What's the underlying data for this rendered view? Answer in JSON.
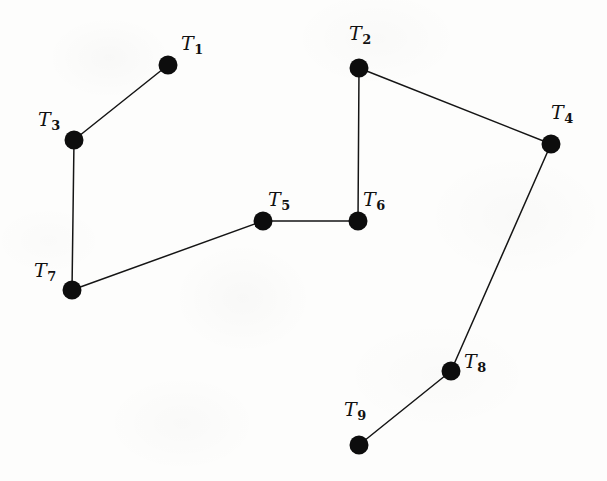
{
  "figure": {
    "kind": "undirected-graph-diagram",
    "background_color": "#fdfdfc",
    "ink_color": "#111111",
    "width": 607,
    "height": 481,
    "vertex_radius": 9.5,
    "edge_stroke_width": 1.5
  },
  "vertices": [
    {
      "id": "T1",
      "label": "T",
      "subscript": "1",
      "x": 168,
      "y": 65,
      "label_x": 181,
      "label_y": 34
    },
    {
      "id": "T2",
      "label": "T",
      "subscript": "2",
      "x": 359,
      "y": 68,
      "label_x": 349,
      "label_y": 24
    },
    {
      "id": "T3",
      "label": "T",
      "subscript": "3",
      "x": 74,
      "y": 140,
      "label_x": 38,
      "label_y": 110
    },
    {
      "id": "T4",
      "label": "T",
      "subscript": "4",
      "x": 551,
      "y": 144,
      "label_x": 551,
      "label_y": 103
    },
    {
      "id": "T5",
      "label": "T",
      "subscript": "5",
      "x": 263,
      "y": 221,
      "label_x": 268,
      "label_y": 190
    },
    {
      "id": "T6",
      "label": "T",
      "subscript": "6",
      "x": 358,
      "y": 221,
      "label_x": 363,
      "label_y": 190
    },
    {
      "id": "T7",
      "label": "T",
      "subscript": "7",
      "x": 72,
      "y": 290,
      "label_x": 34,
      "label_y": 261
    },
    {
      "id": "T8",
      "label": "T",
      "subscript": "8",
      "x": 451,
      "y": 371,
      "label_x": 464,
      "label_y": 352
    },
    {
      "id": "T9",
      "label": "T",
      "subscript": "9",
      "x": 359,
      "y": 445,
      "label_x": 344,
      "label_y": 400
    }
  ],
  "edges": [
    {
      "id": "edge-T1-T3",
      "from": "T1",
      "to": "T3",
      "x1": 168,
      "y1": 65,
      "x2": 74,
      "y2": 140
    },
    {
      "id": "edge-T2-T4",
      "from": "T2",
      "to": "T4",
      "x1": 359,
      "y1": 68,
      "x2": 551,
      "y2": 144
    },
    {
      "id": "edge-T2-T6",
      "from": "T2",
      "to": "T6",
      "x1": 359,
      "y1": 68,
      "x2": 358,
      "y2": 221
    },
    {
      "id": "edge-T3-T7",
      "from": "T3",
      "to": "T7",
      "x1": 74,
      "y1": 140,
      "x2": 72,
      "y2": 290
    },
    {
      "id": "edge-T5-T6",
      "from": "T5",
      "to": "T6",
      "x1": 263,
      "y1": 221,
      "x2": 358,
      "y2": 221
    },
    {
      "id": "edge-T5-T7",
      "from": "T5",
      "to": "T7",
      "x1": 263,
      "y1": 221,
      "x2": 72,
      "y2": 290
    },
    {
      "id": "edge-T4-T8",
      "from": "T4",
      "to": "T8",
      "x1": 551,
      "y1": 144,
      "x2": 451,
      "y2": 371
    },
    {
      "id": "edge-T8-T9",
      "from": "T8",
      "to": "T9",
      "x1": 451,
      "y1": 371,
      "x2": 359,
      "y2": 445
    }
  ]
}
